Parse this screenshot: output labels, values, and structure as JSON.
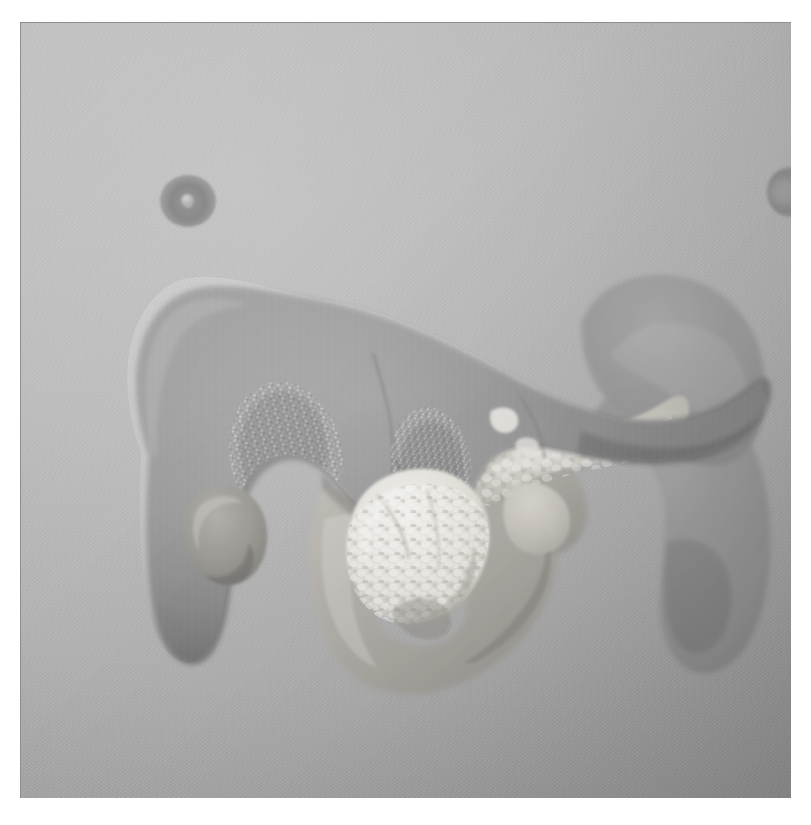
{
  "figure": {
    "kind": "3d-anatomical-render",
    "modality": "grayscale surface rendering",
    "background_color": "#b8b8b8",
    "plate": {
      "x": 20,
      "y": 22,
      "width": 771,
      "height": 776
    },
    "page_background": "#ffffff",
    "border_color": "#8e8e8e"
  },
  "structures": [
    {
      "id": "liver",
      "name": "liver",
      "label": "Liver",
      "tone": "#8a8a8a",
      "description": "Large dark-gray lobed organ occupying the upper-left two thirds of the frame, with right lobe at left and a narrowing body extending to the right.",
      "surface": "smooth with two nodular / granular patches on the inferior right lobe"
    },
    {
      "id": "liver-nodular-patch-left",
      "name": "liver-nodular-patch-left",
      "label": "Nodular surface patch (left)",
      "tone": "#9b9b9b",
      "description": "Speckled bright granular texture region on the inferior aspect of the right hepatic lobe."
    },
    {
      "id": "liver-nodular-patch-right",
      "name": "liver-nodular-patch-right",
      "label": "Nodular surface patch (right)",
      "tone": "#9b9b9b",
      "description": "Second speckled granular texture region medial to the first, near the caudate region."
    },
    {
      "id": "gallbladder",
      "name": "gallbladder",
      "label": "Gallbladder",
      "tone": "#9a9a9a",
      "description": "Small rounded pear-shaped bulge protruding from the inferior border of the left portion of the liver."
    },
    {
      "id": "pancreas-head",
      "name": "pancreas-head",
      "label": "Pancreas head",
      "tone": "#f2f0ea",
      "description": "Bright white lobulated nodular mass in the lower-center of the frame, cradled by the duodenal loop."
    },
    {
      "id": "pancreas-body-tail",
      "name": "pancreas-body-tail",
      "label": "Pancreas body and tail",
      "tone": "#d8d6d0",
      "description": "Light elongated lobulated band running up and to the right from the pancreatic head toward the splenic hilum."
    },
    {
      "id": "duodenum",
      "name": "duodenum",
      "label": "Duodenum",
      "tone": "#b6b3ad",
      "description": "C-shaped loop of medium-light gray bowel encircling the pancreatic head in the lower-center of the frame."
    },
    {
      "id": "stomach",
      "name": "stomach",
      "label": "Stomach",
      "tone": "#9e9e9e",
      "description": "Large curved translucent mid-gray structure occupying the right third of the frame, descending from the upper right."
    },
    {
      "id": "vessel-marker-left",
      "name": "vessel-marker-left",
      "label": "Vessel cross-section (left)",
      "tone": "#838383",
      "description": "Small dark ring with a lighter center in the upper-left background, a vessel seen end-on."
    },
    {
      "id": "vessel-marker-right",
      "name": "vessel-marker-right",
      "label": "Vessel cross-section (right)",
      "tone": "#8a8a8a",
      "description": "Small dark blurred spot near the upper-right edge of the plate."
    }
  ]
}
